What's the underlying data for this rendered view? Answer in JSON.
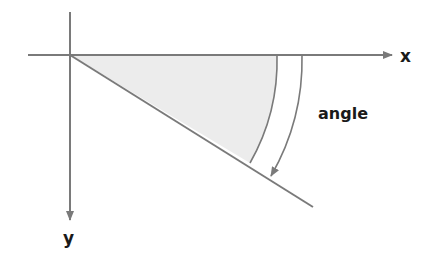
{
  "diagram": {
    "labels": {
      "x_axis": "x",
      "y_axis": "y",
      "angle": "angle"
    },
    "colors": {
      "line": "#7a7a7a",
      "fill": "#ececec",
      "text": "#1a1a1a"
    }
  }
}
